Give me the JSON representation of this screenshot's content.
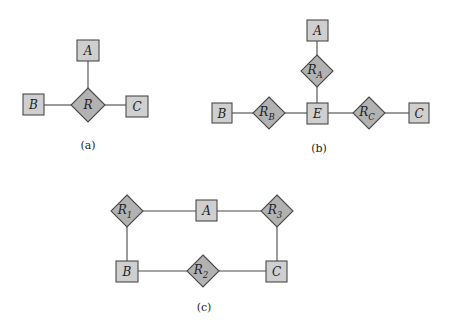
{
  "diagrams": {
    "a": {
      "caption": "(a)",
      "entities": {
        "A": "A",
        "B": "B",
        "C": "C"
      },
      "relationships": {
        "R": "R"
      },
      "edges": [
        [
          "R",
          "A"
        ],
        [
          "R",
          "B"
        ],
        [
          "R",
          "C"
        ]
      ]
    },
    "b": {
      "caption": "(b)",
      "entities": {
        "A": "A",
        "B": "B",
        "C": "C",
        "E": "E"
      },
      "relationships": {
        "RA": {
          "base": "R",
          "sub": "A"
        },
        "RB": {
          "base": "R",
          "sub": "B"
        },
        "RC": {
          "base": "R",
          "sub": "C"
        }
      },
      "edges": [
        [
          "A",
          "RA"
        ],
        [
          "RA",
          "E"
        ],
        [
          "B",
          "RB"
        ],
        [
          "RB",
          "E"
        ],
        [
          "E",
          "RC"
        ],
        [
          "RC",
          "C"
        ]
      ]
    },
    "c": {
      "caption": "(c)",
      "entities": {
        "A": "A",
        "B": "B",
        "C": "C"
      },
      "relationships": {
        "R1": {
          "base": "R",
          "sub": "1"
        },
        "R2": {
          "base": "R",
          "sub": "2"
        },
        "R3": {
          "base": "R",
          "sub": "3"
        }
      },
      "edges": [
        [
          "R1",
          "A"
        ],
        [
          "A",
          "R3"
        ],
        [
          "R1",
          "B"
        ],
        [
          "B",
          "R2"
        ],
        [
          "R2",
          "C"
        ],
        [
          "R3",
          "C"
        ]
      ]
    }
  },
  "colors": {
    "entity_fill": "#cfcfcf",
    "relationship_fill": "#b2b2b2",
    "stroke": "#4a4a4a"
  }
}
